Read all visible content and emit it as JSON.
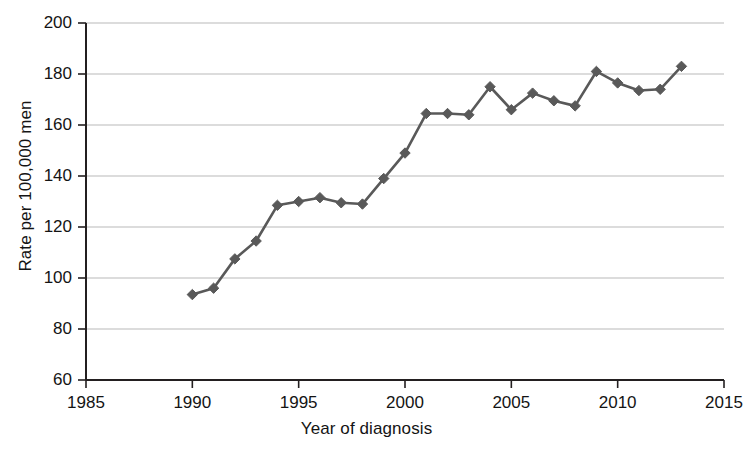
{
  "chart_data": {
    "type": "line",
    "title": "",
    "subtitle": "",
    "xlabel": "Year of diagnosis",
    "ylabel": "Rate per 100,000 men",
    "xlim": [
      1985,
      2015
    ],
    "ylim": [
      60,
      200
    ],
    "xticks": [
      1985,
      1990,
      1995,
      2000,
      2005,
      2010,
      2015
    ],
    "xtick_labels": [
      "1985",
      "1990",
      "1995",
      "2000",
      "2005",
      "2010",
      "2015"
    ],
    "yticks": [
      60,
      80,
      100,
      120,
      140,
      160,
      180,
      200
    ],
    "ytick_labels": [
      "60",
      "80",
      "100",
      "120",
      "140",
      "160",
      "180",
      "200"
    ],
    "grid": "horizontal",
    "legend": null,
    "legend_position": "none",
    "marker": "diamond",
    "series_color": "#595959",
    "grid_color": "#b9b9b9",
    "axis_color": "#231f20",
    "x": [
      1990,
      1991,
      1992,
      1993,
      1994,
      1995,
      1996,
      1997,
      1998,
      1999,
      2000,
      2001,
      2002,
      2003,
      2004,
      2005,
      2006,
      2007,
      2008,
      2009,
      2010,
      2011,
      2012,
      2013
    ],
    "values": [
      93.5,
      96.0,
      107.5,
      114.5,
      128.5,
      130.0,
      131.5,
      129.5,
      129.0,
      139.0,
      149.0,
      164.5,
      164.5,
      164.0,
      175.0,
      166.0,
      172.5,
      169.5,
      167.5,
      181.0,
      176.5,
      173.5,
      174.0,
      183.0
    ],
    "series": [
      {
        "name": "Rate per 100,000 men",
        "values": [
          93.5,
          96.0,
          107.5,
          114.5,
          128.5,
          130.0,
          131.5,
          129.5,
          129.0,
          139.0,
          149.0,
          164.5,
          164.5,
          164.0,
          175.0,
          166.0,
          172.5,
          169.5,
          167.5,
          181.0,
          176.5,
          173.5,
          174.0,
          183.0
        ]
      }
    ]
  },
  "figure": {
    "background_color": "#ffffff"
  }
}
